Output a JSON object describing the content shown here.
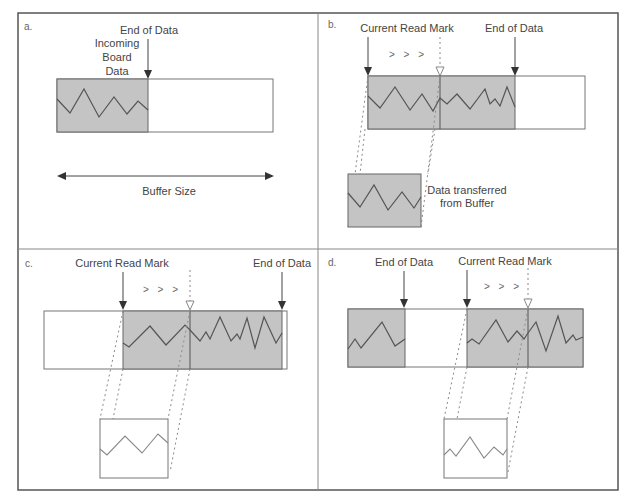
{
  "figure": {
    "width": 633,
    "height": 503,
    "frame": {
      "x": 18,
      "y": 13,
      "w": 600,
      "h": 477
    },
    "divider_x": 318,
    "divider_y": 249
  },
  "panels": [
    {
      "id": "a",
      "letter": "a.",
      "labels": {
        "incoming_line1": "Incoming",
        "incoming_line2": "Board",
        "incoming_line3": "Data",
        "end_of_data": "End of Data",
        "buffer_size": "Buffer Size"
      }
    },
    {
      "id": "b",
      "letter": "b.",
      "labels": {
        "current_read_mark": "Current Read Mark",
        "end_of_data": "End of Data",
        "progress": "> > >",
        "transferred_line1": "Data transferred",
        "transferred_line2": "from Buffer"
      }
    },
    {
      "id": "c",
      "letter": "c.",
      "labels": {
        "current_read_mark": "Current Read Mark",
        "end_of_data": "End of Data",
        "progress": "> > >"
      }
    },
    {
      "id": "d",
      "letter": "d.",
      "labels": {
        "end_of_data": "End of Data",
        "current_read_mark": "Current Read Mark",
        "progress": "> > >"
      }
    }
  ],
  "colors": {
    "shaded_data": "#c4c4c4",
    "stroke": "#555555",
    "background": "#ffffff"
  }
}
